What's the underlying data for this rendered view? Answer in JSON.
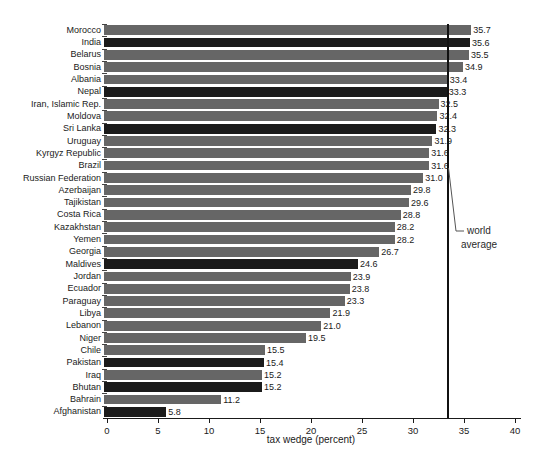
{
  "chart_data": {
    "type": "bar",
    "orientation": "horizontal",
    "title": "",
    "xlabel": "tax wedge (percent)",
    "ylabel": "",
    "xlim": [
      0,
      40
    ],
    "xticks": [
      0,
      5,
      10,
      15,
      20,
      25,
      30,
      35,
      40
    ],
    "grid": false,
    "legend": "none",
    "colors": {
      "default_bar": "#666666",
      "highlight_bar": "#1b1b1b",
      "axis": "#1a1a1a",
      "annotation_line": "#555555"
    },
    "annotation": {
      "label": "world average",
      "line1": "world",
      "line2": "average",
      "value": 33.4
    },
    "bars": [
      {
        "label": "Morocco",
        "value": 35.7,
        "highlight": false
      },
      {
        "label": "India",
        "value": 35.6,
        "highlight": true
      },
      {
        "label": "Belarus",
        "value": 35.5,
        "highlight": false
      },
      {
        "label": "Bosnia",
        "value": 34.9,
        "highlight": false
      },
      {
        "label": "Albania",
        "value": 33.4,
        "highlight": false
      },
      {
        "label": "Nepal",
        "value": 33.3,
        "highlight": true
      },
      {
        "label": "Iran, Islamic Rep.",
        "value": 32.5,
        "highlight": false
      },
      {
        "label": "Moldova",
        "value": 32.4,
        "highlight": false
      },
      {
        "label": "Sri Lanka",
        "value": 32.3,
        "highlight": true
      },
      {
        "label": "Uruguay",
        "value": 31.9,
        "highlight": false
      },
      {
        "label": "Kyrgyz Republic",
        "value": 31.6,
        "highlight": false
      },
      {
        "label": "Brazil",
        "value": 31.6,
        "highlight": false
      },
      {
        "label": "Russian Federation",
        "value": 31.0,
        "highlight": false
      },
      {
        "label": "Azerbaijan",
        "value": 29.8,
        "highlight": false
      },
      {
        "label": "Tajikistan",
        "value": 29.6,
        "highlight": false
      },
      {
        "label": "Costa Rica",
        "value": 28.8,
        "highlight": false
      },
      {
        "label": "Kazakhstan",
        "value": 28.2,
        "highlight": false
      },
      {
        "label": "Yemen",
        "value": 28.2,
        "highlight": false
      },
      {
        "label": "Georgia",
        "value": 26.7,
        "highlight": false
      },
      {
        "label": "Maldives",
        "value": 24.6,
        "highlight": true
      },
      {
        "label": "Jordan",
        "value": 23.9,
        "highlight": false
      },
      {
        "label": "Ecuador",
        "value": 23.8,
        "highlight": false
      },
      {
        "label": "Paraguay",
        "value": 23.3,
        "highlight": false
      },
      {
        "label": "Libya",
        "value": 21.9,
        "highlight": false
      },
      {
        "label": "Lebanon",
        "value": 21.0,
        "highlight": false
      },
      {
        "label": "Niger",
        "value": 19.5,
        "highlight": false
      },
      {
        "label": "Chile",
        "value": 15.5,
        "highlight": false
      },
      {
        "label": "Pakistan",
        "value": 15.4,
        "highlight": true
      },
      {
        "label": "Iraq",
        "value": 15.2,
        "highlight": false
      },
      {
        "label": "Bhutan",
        "value": 15.2,
        "highlight": true
      },
      {
        "label": "Bahrain",
        "value": 11.2,
        "highlight": false
      },
      {
        "label": "Afghanistan",
        "value": 5.8,
        "highlight": true
      }
    ]
  }
}
